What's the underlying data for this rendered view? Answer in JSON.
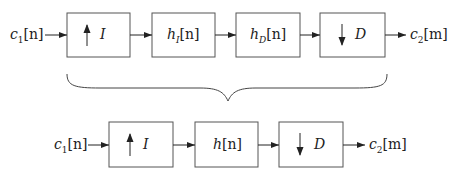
{
  "top_row": {
    "input": {
      "base": "c",
      "sub": "1",
      "index": "[n]"
    },
    "blocks": [
      {
        "kind": "upsampler",
        "arrow": "up-arrow",
        "label": "I"
      },
      {
        "kind": "filter",
        "base": "h",
        "sub": "I",
        "index": "[n]"
      },
      {
        "kind": "filter",
        "base": "h",
        "sub": "D",
        "index": "[n]"
      },
      {
        "kind": "downsampler",
        "arrow": "down-arrow",
        "label": "D"
      }
    ],
    "output": {
      "base": "c",
      "sub": "2",
      "index": "[m]"
    }
  },
  "bottom_row": {
    "input": {
      "base": "c",
      "sub": "1",
      "index": "[n]"
    },
    "blocks": [
      {
        "kind": "upsampler",
        "arrow": "up-arrow",
        "label": "I"
      },
      {
        "kind": "filter",
        "base": "h",
        "sub": "",
        "index": "[n]"
      },
      {
        "kind": "downsampler",
        "arrow": "down-arrow",
        "label": "D"
      }
    ],
    "output": {
      "base": "c",
      "sub": "2",
      "index": "[m]"
    }
  },
  "colors": {
    "stroke": "#333333",
    "box_border": "#555555"
  }
}
